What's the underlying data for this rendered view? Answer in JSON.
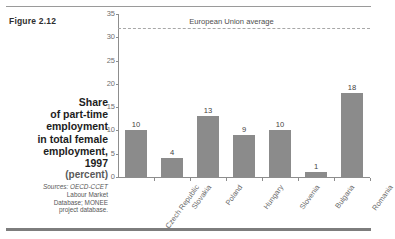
{
  "figure": {
    "label": "Figure 2.12"
  },
  "caption": {
    "title_lines": [
      "Share",
      "of part-time",
      "employment",
      "in total female",
      "employment,",
      "1997"
    ],
    "unit": "(percent)",
    "sources_label": "Sources:",
    "sources_lines": [
      "Sources: OECD-CCET",
      "Labour Market",
      "Database; MONEE",
      "project database."
    ]
  },
  "chart_data": {
    "type": "bar",
    "title": "Share of part-time employment in total female employment, 1997",
    "xlabel": "",
    "ylabel": "(percent)",
    "ylim": [
      0,
      35
    ],
    "yticks": [
      0,
      5,
      10,
      15,
      20,
      25,
      30,
      35
    ],
    "grid": false,
    "legend": "none",
    "categories": [
      "Czech Republic",
      "Slovakia",
      "Poland",
      "Hungary",
      "Slovenia",
      "Bulgaria",
      "Romania"
    ],
    "values": [
      10,
      4,
      13,
      9,
      10,
      1,
      18
    ],
    "value_labels": [
      "10",
      "4",
      "13",
      "9",
      "10",
      "1",
      "18"
    ],
    "bar_color": "#8b8b8b",
    "annotations": [
      {
        "name": "european-union-average",
        "label": "European Union average",
        "value": 32,
        "style": "dashed-horizontal-line",
        "color": "#a8a8a8"
      }
    ]
  },
  "colors": {
    "bar": "#8b8b8b",
    "axis": "#8d8d8d",
    "eu_line": "#a8a8a8",
    "rule": "#7d7d7d",
    "text": "#3b3b3b"
  }
}
